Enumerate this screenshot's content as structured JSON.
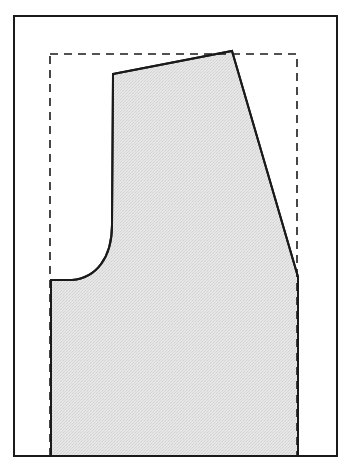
{
  "diagram": {
    "type": "pattern-piece",
    "colors": {
      "background": "#ffffff",
      "stroke": "#1a1a1a",
      "fill": "#e4e4e4",
      "dashed": "#1a1a1a"
    },
    "outer_frame": {
      "x": 14,
      "y": 16,
      "width": 323,
      "height": 440
    },
    "dashed_rect": {
      "x": 50,
      "y": 54,
      "width": 247,
      "height": 402
    },
    "shape": {
      "top_left": [
        113,
        74
      ],
      "peak": [
        232,
        51
      ],
      "right_join": [
        298,
        277
      ],
      "bottom_right": [
        298,
        456
      ],
      "bottom_left": [
        51,
        456
      ],
      "notch_left": [
        51,
        280
      ],
      "curve_start": [
        72,
        280
      ],
      "curve_end": [
        112,
        225
      ]
    }
  }
}
